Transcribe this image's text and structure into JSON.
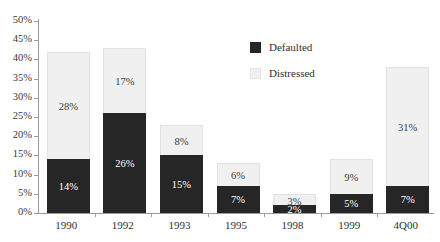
{
  "chart_data": {
    "type": "bar",
    "subtype": "stacked-vertical",
    "title": "",
    "title_sliver": "",
    "xlabel": "",
    "ylabel": "",
    "categories": [
      "1990",
      "1992",
      "1993",
      "1995",
      "1998",
      "1999",
      "4Q00"
    ],
    "series": [
      {
        "name": "Defaulted",
        "color": "#262626",
        "values": [
          14,
          26,
          15,
          7,
          2,
          5,
          7
        ],
        "labels": [
          "14%",
          "26%",
          "15%",
          "7%",
          "2%",
          "5%",
          "7%"
        ]
      },
      {
        "name": "Distressed",
        "color": "#f0f0f0",
        "values": [
          28,
          17,
          8,
          6,
          3,
          9,
          31
        ],
        "labels": [
          "28%",
          "17%",
          "8%",
          "6%",
          "3%",
          "9%",
          "31%"
        ]
      }
    ],
    "totals": [
      42,
      43,
      23,
      13,
      5,
      14,
      38
    ],
    "ylim": [
      0,
      50
    ],
    "ytick_step": 5,
    "ytick_labels": [
      "50%",
      "45%",
      "40%",
      "35%",
      "30%",
      "25%",
      "20%",
      "15%",
      "10%",
      "5%",
      "0%"
    ],
    "ytick_values": [
      50,
      45,
      40,
      35,
      30,
      25,
      20,
      15,
      10,
      5,
      0
    ],
    "grid": false,
    "legend_position": "top-right",
    "value_labels_shown": true
  },
  "legend": {
    "items": [
      {
        "label": "Defaulted",
        "swatch": "defaulted"
      },
      {
        "label": "Distressed",
        "swatch": "distressed"
      }
    ]
  }
}
